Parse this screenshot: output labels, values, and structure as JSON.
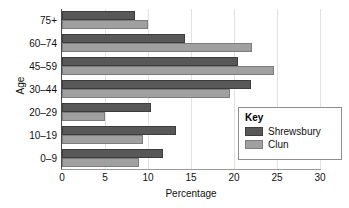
{
  "chart_data": {
    "type": "bar",
    "orientation": "horizontal",
    "title": "",
    "xlabel": "Percentage",
    "ylabel": "Age",
    "categories": [
      "0–9",
      "10–19",
      "20–29",
      "30–44",
      "45–59",
      "60–74",
      "75+"
    ],
    "series": [
      {
        "name": "Shrewsbury",
        "color": "#585858",
        "values": [
          11.8,
          13.2,
          10.3,
          22.0,
          20.5,
          14.3,
          8.5
        ]
      },
      {
        "name": "Clun",
        "color": "#a0a0a0",
        "values": [
          9.0,
          9.4,
          5.0,
          19.5,
          24.7,
          22.1,
          10.0
        ]
      }
    ],
    "xlim": [
      0,
      30
    ],
    "xticks": [
      0,
      5,
      10,
      15,
      20,
      25,
      30
    ],
    "xtick_labels": [
      "0",
      "5",
      "10",
      "15",
      "20",
      "25",
      "30"
    ],
    "grid": "vertical",
    "legend": {
      "title": "Key",
      "position": "bottom-right"
    }
  }
}
